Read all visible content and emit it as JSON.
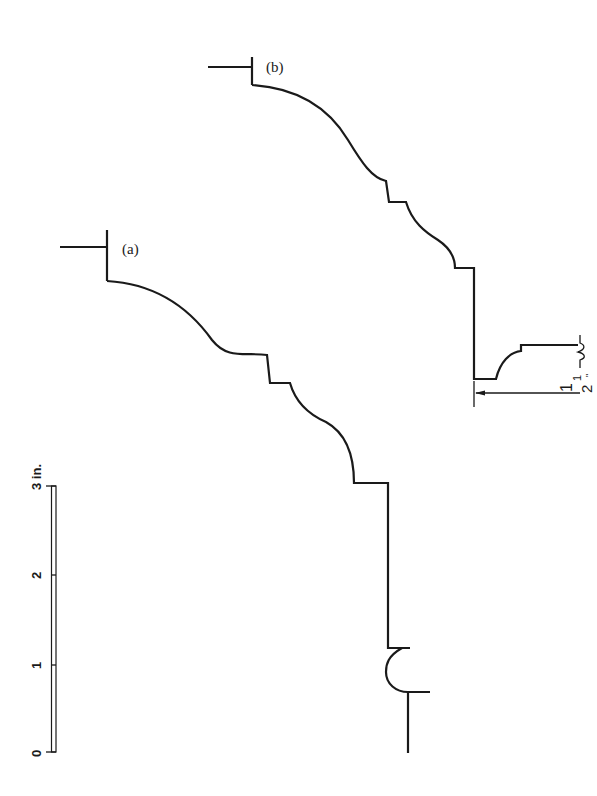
{
  "diagram": {
    "type": "architectural moulding profiles (cornice sections)",
    "profiles": [
      {
        "id": "a",
        "label": "(a)"
      },
      {
        "id": "b",
        "label": "(b)"
      }
    ],
    "dimension": {
      "label_whole": "1",
      "label_num": "1",
      "label_den": "2",
      "label_unit": "\"",
      "text": "1½\""
    },
    "scale_bar": {
      "unit_label": "3 in.",
      "ticks": [
        {
          "value": "0",
          "label": "0"
        },
        {
          "value": "1",
          "label": "1"
        },
        {
          "value": "2",
          "label": "2"
        },
        {
          "value": "3",
          "label": "3 in."
        }
      ]
    },
    "colors": {
      "ink": "#1a1a1a",
      "background": "#ffffff"
    }
  }
}
